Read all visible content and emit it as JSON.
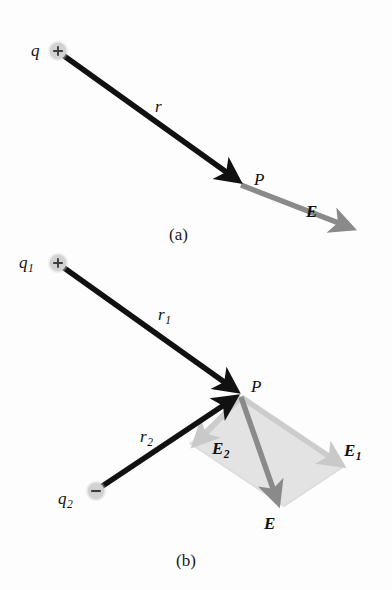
{
  "figure": {
    "background_color": "#fdfdfd"
  },
  "colors": {
    "vector_black": "#111111",
    "field_gray": "#8a8a8a",
    "component_gray": "#c9c9c9",
    "parallelogram_fill": "#e2e2e2",
    "charge_marker_fill": "#d6d6d6",
    "charge_sign": "#3a3a3a",
    "text": "#111111"
  },
  "panel_a": {
    "caption": "(a)",
    "charge": {
      "label": "q",
      "sign": "+",
      "sign_glyph": "+"
    },
    "distance_label": "r",
    "point_label": "P",
    "field_label": "E"
  },
  "panel_b": {
    "caption": "(b)",
    "charge1": {
      "label": "q",
      "subscript": "1",
      "sign": "+",
      "sign_glyph": "+"
    },
    "charge2": {
      "label": "q",
      "subscript": "2",
      "sign": "−",
      "sign_glyph": "−"
    },
    "distance1": {
      "label": "r",
      "subscript": "1"
    },
    "distance2": {
      "label": "r",
      "subscript": "2"
    },
    "point_label": "P",
    "field1": {
      "label": "E",
      "subscript": "1"
    },
    "field2": {
      "label": "E",
      "subscript": "2"
    },
    "resultant": {
      "label": "E",
      "subscript": ""
    }
  },
  "icons": {
    "positive_charge": "plus-circle-icon",
    "negative_charge": "minus-circle-icon",
    "arrow": "arrow-icon"
  }
}
